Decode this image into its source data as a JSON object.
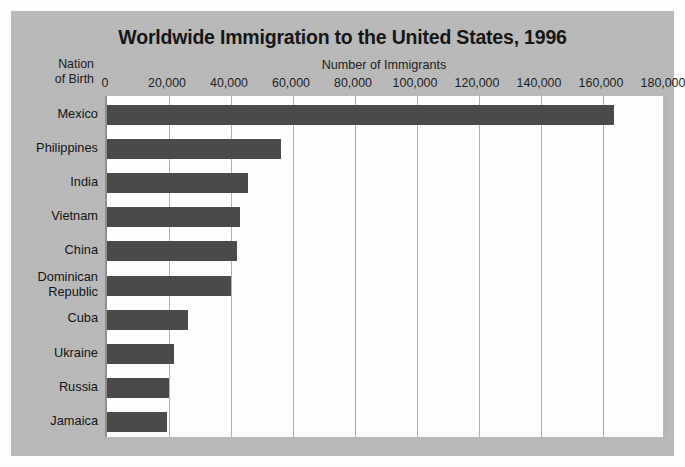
{
  "chart_data": {
    "type": "bar",
    "orientation": "horizontal",
    "title": "Worldwide Immigration to the United States, 1996",
    "xlabel": "Number of Immigrants",
    "ylabel": "Nation of Birth",
    "ylabel_line1": "Nation",
    "ylabel_line2": "of Birth",
    "xlim": [
      0,
      180000
    ],
    "xticks": [
      0,
      20000,
      40000,
      60000,
      80000,
      100000,
      120000,
      140000,
      160000,
      180000
    ],
    "xtick_labels": [
      "0",
      "20,000",
      "40,000",
      "60,000",
      "80,000",
      "100,000",
      "120,000",
      "140,000",
      "160,000",
      "180,000"
    ],
    "grid": "vertical",
    "legend": "none",
    "categories": [
      "Mexico",
      "Philippines",
      "India",
      "Vietnam",
      "China",
      "Dominican Republic",
      "Cuba",
      "Ukraine",
      "Russia",
      "Jamaica"
    ],
    "category_labels": [
      [
        "Mexico"
      ],
      [
        "Philippines"
      ],
      [
        "India"
      ],
      [
        "Vietnam"
      ],
      [
        "China"
      ],
      [
        "Dominican",
        "Republic"
      ],
      [
        "Cuba"
      ],
      [
        "Ukraine"
      ],
      [
        "Russia"
      ],
      [
        "Jamaica"
      ]
    ],
    "values": [
      163500,
      56000,
      45500,
      43000,
      42000,
      40000,
      26000,
      21500,
      20000,
      19500
    ],
    "bar_color": "#4a4a4a",
    "panel_color": "#b9b9b9",
    "plot_background": "#ffffff",
    "gridline_color": "#b0b0b0",
    "text_color": "#1c1c1c"
  }
}
